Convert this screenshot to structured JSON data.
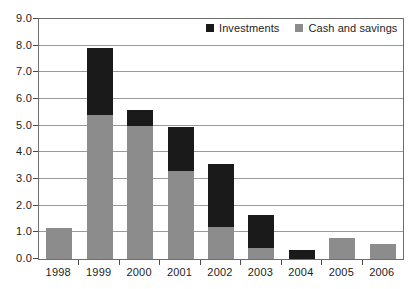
{
  "chart_data": {
    "type": "bar",
    "barmode": "stacked",
    "title": "",
    "subtitle": "",
    "xlabel": "",
    "ylabel": "",
    "categories": [
      "1998",
      "1999",
      "2000",
      "2001",
      "2002",
      "2003",
      "2004",
      "2005",
      "2006"
    ],
    "series": [
      {
        "name": "Investments",
        "color": "#1a1a1a",
        "values": [
          0.0,
          2.5,
          0.6,
          1.65,
          2.35,
          1.25,
          0.35,
          0.0,
          0.0
        ]
      },
      {
        "name": "Cash and savings",
        "color": "#8c8c8c",
        "values": [
          1.15,
          5.4,
          5.0,
          3.3,
          1.2,
          0.4,
          0.0,
          0.8,
          0.55
        ]
      }
    ],
    "totals": [
      1.15,
      7.9,
      5.6,
      4.95,
      3.55,
      1.65,
      0.35,
      0.8,
      0.55
    ],
    "ylim": [
      0.0,
      9.0
    ],
    "ytick_labels": [
      "0.0",
      "1.0",
      "2.0",
      "3.0",
      "4.0",
      "5.0",
      "6.0",
      "7.0",
      "8.0",
      "9.0"
    ],
    "ytick_values": [
      0.0,
      1.0,
      2.0,
      3.0,
      4.0,
      5.0,
      6.0,
      7.0,
      8.0,
      9.0
    ],
    "grid": true,
    "grid_axis": "y",
    "legend_position": "top-right-inside",
    "legend": [
      {
        "label": "Investments",
        "color": "#1a1a1a"
      },
      {
        "label": "Cash and savings",
        "color": "#8c8c8c"
      }
    ]
  }
}
